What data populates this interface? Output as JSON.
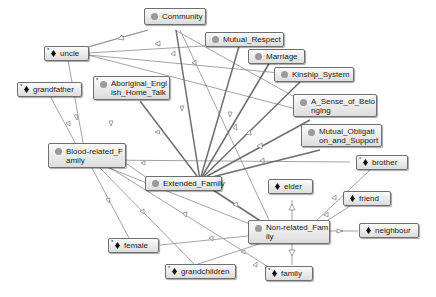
{
  "diagram": {
    "type": "ontology-graph",
    "classes": [
      {
        "id": "community",
        "label": "Community",
        "kind": "class"
      },
      {
        "id": "mutual_respect",
        "label": "Mutual_Respect",
        "kind": "class"
      },
      {
        "id": "marriage",
        "label": "Marriage",
        "kind": "class"
      },
      {
        "id": "kinship_system",
        "label": "Kinship_System",
        "kind": "class"
      },
      {
        "id": "sense_of_belonging",
        "label": "A_Sense_of_Belo\nnging",
        "kind": "class"
      },
      {
        "id": "mutual_obligation",
        "label": "Mutual_Obligati\non_and_Support",
        "kind": "class"
      },
      {
        "id": "aboriginal_english",
        "label": "Aboriginal_Engl\nish_Home_Talk",
        "kind": "class",
        "starred": true
      },
      {
        "id": "blood_related",
        "label": "Blood-related_F\namily",
        "kind": "class"
      },
      {
        "id": "extended_family",
        "label": "Extended_Family",
        "kind": "class"
      },
      {
        "id": "non_related",
        "label": "Non-related_Fam\nily",
        "kind": "class"
      }
    ],
    "individuals": [
      {
        "id": "uncle",
        "label": "uncle",
        "starred": true
      },
      {
        "id": "grandfather",
        "label": "grandfather",
        "starred": true
      },
      {
        "id": "brother",
        "label": "brother",
        "starred": true
      },
      {
        "id": "elder",
        "label": "elder",
        "starred": false
      },
      {
        "id": "friend",
        "label": "friend",
        "starred": false
      },
      {
        "id": "neighbour",
        "label": "neighbour",
        "starred": false
      },
      {
        "id": "female",
        "label": "female",
        "starred": true
      },
      {
        "id": "grandchildren",
        "label": "grandchildren",
        "starred": true
      },
      {
        "id": "family",
        "label": "family",
        "starred": true
      }
    ],
    "star_marker": "*",
    "edges": [
      [
        "uncle",
        "community"
      ],
      [
        "uncle",
        "marriage"
      ],
      [
        "uncle",
        "kinship_system"
      ],
      [
        "uncle",
        "sense_of_belonging"
      ],
      [
        "blood_related",
        "uncle"
      ],
      [
        "blood_related",
        "grandfather"
      ],
      [
        "extended_family",
        "community"
      ],
      [
        "extended_family",
        "mutual_respect"
      ],
      [
        "extended_family",
        "marriage"
      ],
      [
        "extended_family",
        "kinship_system"
      ],
      [
        "extended_family",
        "sense_of_belonging"
      ],
      [
        "extended_family",
        "mutual_obligation"
      ],
      [
        "extended_family",
        "aboriginal_english"
      ],
      [
        "extended_family",
        "blood_related"
      ],
      [
        "extended_family",
        "non_related"
      ],
      [
        "blood_related",
        "brother"
      ],
      [
        "blood_related",
        "female"
      ],
      [
        "blood_related",
        "grandchildren"
      ],
      [
        "blood_related",
        "family"
      ],
      [
        "non_related",
        "elder"
      ],
      [
        "non_related",
        "friend"
      ],
      [
        "non_related",
        "neighbour"
      ],
      [
        "non_related",
        "family"
      ],
      [
        "non_related",
        "brother"
      ],
      [
        "non_related",
        "female"
      ],
      [
        "non_related",
        "grandchildren"
      ],
      [
        "community",
        "non_related"
      ],
      [
        "community",
        "sense_of_belonging"
      ]
    ]
  }
}
